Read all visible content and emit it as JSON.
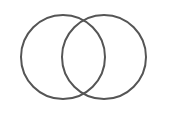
{
  "diagram": {
    "type": "venn",
    "sets": [
      {
        "id": "left",
        "cx": 63,
        "cy": 57,
        "r": 42
      },
      {
        "id": "right",
        "cx": 104,
        "cy": 57,
        "r": 42
      }
    ],
    "stroke_color": "#555555",
    "background": "#ffffff"
  }
}
